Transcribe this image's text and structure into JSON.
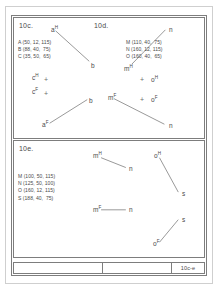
{
  "sheet": {
    "titleblock": {
      "drawing_number": "10c-e"
    }
  },
  "panels": {
    "top": {
      "left_caption": "10c.",
      "right_caption": "10d.",
      "coords_left": "A (50, 12, 115)\nB (88, 40,  75)\nC (35, 50,  65)",
      "coords_right": "M (110, 40,  75)\nN (160, 12, 115)\nO (160, 40,  65)",
      "markers_left": [
        {
          "label": "c",
          "sup": "H",
          "symbol": "+"
        },
        {
          "label": "c",
          "sup": "F",
          "symbol": "+"
        }
      ],
      "markers_right": [
        {
          "symbol": "+",
          "label": "o",
          "sup": "H"
        },
        {
          "symbol": "+",
          "label": "o",
          "sup": "F"
        }
      ],
      "nodes": [
        {
          "label": "a",
          "sup": "H"
        },
        {
          "label": "b",
          "sup": ""
        },
        {
          "label": "b",
          "sup": ""
        },
        {
          "label": "a",
          "sup": "F"
        },
        {
          "label": "n",
          "sup": ""
        },
        {
          "label": "m",
          "sup": "H"
        },
        {
          "label": "m",
          "sup": "F"
        },
        {
          "label": "n",
          "sup": ""
        }
      ]
    },
    "bottom": {
      "caption": "10e.",
      "coords": "M (100, 50, 115)\nN (125, 50, 100)\nO (160, 12, 115)\nS (188, 40,  75)",
      "nodes": [
        {
          "label": "m",
          "sup": "H"
        },
        {
          "label": "n",
          "sup": ""
        },
        {
          "label": "o",
          "sup": "H"
        },
        {
          "label": "s",
          "sup": ""
        },
        {
          "label": "m",
          "sup": "F"
        },
        {
          "label": "n",
          "sup": ""
        },
        {
          "label": "s",
          "sup": ""
        },
        {
          "label": "o",
          "sup": "F"
        }
      ]
    }
  },
  "colors": {
    "line": "#6b6b6b",
    "frame": "#7d7d7d",
    "text": "#4a4a4a",
    "page_border": "#cfcfcf"
  }
}
